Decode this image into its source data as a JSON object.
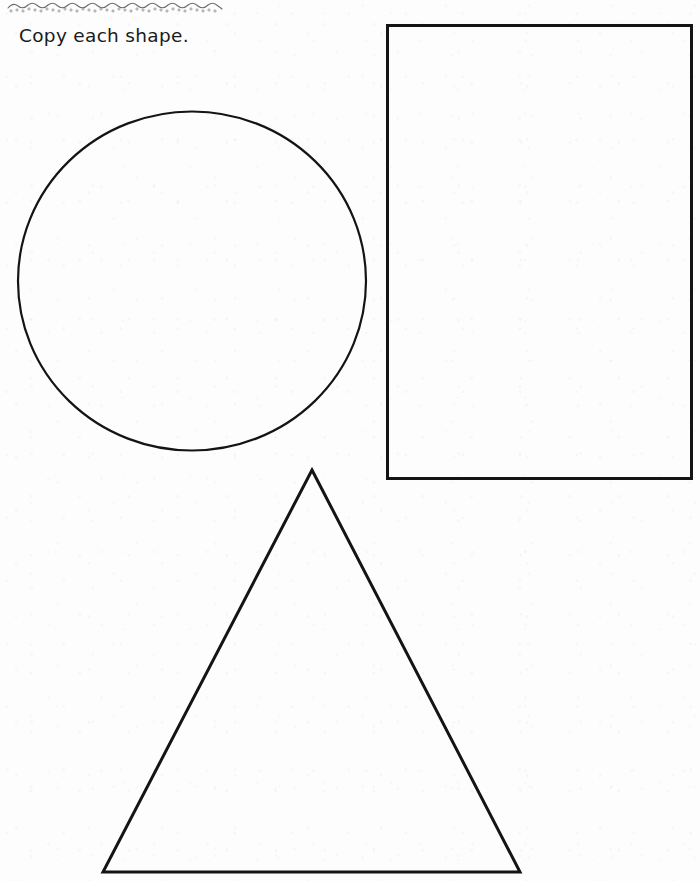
{
  "page": {
    "width": 700,
    "height": 881,
    "background_color": "#fdfdfd",
    "ink_color": "#1a1a1a",
    "media": "scanned-worksheet"
  },
  "decoration": {
    "name": "wavy-dotted-border",
    "description": "scalloped wavy line with small dots along underside",
    "color": "#6e6e72",
    "x": 6,
    "y": 0,
    "width": 218,
    "height": 14,
    "wave_count": 11,
    "dot_count": 34
  },
  "instruction": {
    "text": "Copy each shape.",
    "color": "#1b1b1b",
    "font_size_px": 18.5,
    "x": 19,
    "y": 24
  },
  "shapes": [
    {
      "id": "circle",
      "label": "Circle",
      "type": "ellipse",
      "stroke_color": "#141414",
      "stroke_width": 2.2,
      "fill": "none",
      "cx": 188,
      "cy": 281,
      "rx": 174,
      "ry": 169.5,
      "bbox": {
        "x": 14,
        "y": 112,
        "width": 348,
        "height": 339
      }
    },
    {
      "id": "rectangle",
      "label": "Rectangle",
      "type": "rect",
      "stroke_color": "#141414",
      "stroke_width": 3,
      "fill": "none",
      "bbox": {
        "x": 386,
        "y": 24,
        "width": 304,
        "height": 453
      }
    },
    {
      "id": "triangle",
      "label": "Triangle",
      "type": "polygon",
      "stroke_color": "#141414",
      "stroke_width": 3,
      "fill": "none",
      "points": [
        {
          "x": 312,
          "y": 470
        },
        {
          "x": 520,
          "y": 872
        },
        {
          "x": 103,
          "y": 872
        }
      ],
      "bbox": {
        "x": 103,
        "y": 470,
        "width": 417,
        "height": 402
      }
    }
  ]
}
